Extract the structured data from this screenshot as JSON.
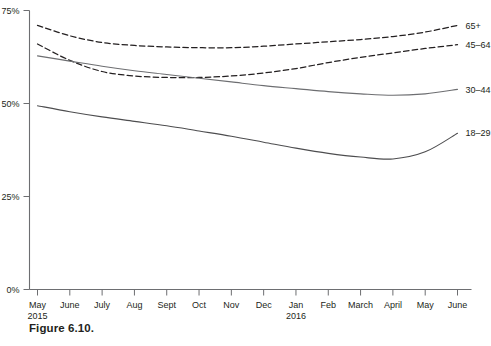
{
  "caption": "Figure 6.10.",
  "chart_data": {
    "type": "line",
    "title": "",
    "xlabel": "",
    "ylabel": "",
    "ylim": [
      0,
      75
    ],
    "yticks": [
      0,
      25,
      50,
      75
    ],
    "ytick_labels": [
      "0%",
      "25%",
      "50%",
      "75%"
    ],
    "grid": false,
    "legend_position": "right-inline-labels",
    "categories": [
      "May",
      "June",
      "July",
      "Aug",
      "Sept",
      "Oct",
      "Nov",
      "Dec",
      "Jan",
      "Feb",
      "March",
      "April",
      "May",
      "June"
    ],
    "category_sublabels": [
      "2015",
      "",
      "",
      "",
      "",
      "",
      "",
      "",
      "2016",
      "",
      "",
      "",
      "",
      ""
    ],
    "series": [
      {
        "name": "65+",
        "style": "dashed",
        "color": "#231f20",
        "values": [
          71.0,
          68.2,
          66.4,
          65.6,
          65.2,
          65.0,
          65.0,
          65.4,
          66.0,
          66.6,
          67.2,
          68.0,
          69.2,
          71.0
        ]
      },
      {
        "name": "45-64",
        "label": "45–64",
        "style": "dashed",
        "color": "#231f20",
        "values": [
          66.0,
          61.6,
          58.6,
          57.4,
          57.0,
          57.0,
          57.4,
          58.2,
          59.4,
          61.0,
          62.4,
          63.6,
          64.8,
          65.8
        ]
      },
      {
        "name": "30-44",
        "label": "30–44",
        "style": "solid",
        "color": "#6d6e71",
        "values": [
          62.8,
          61.4,
          60.0,
          58.8,
          57.8,
          56.8,
          55.8,
          54.8,
          54.0,
          53.2,
          52.6,
          52.2,
          52.6,
          53.8
        ]
      },
      {
        "name": "18-29",
        "label": "18–29",
        "style": "solid",
        "color": "#4d4d4f",
        "values": [
          49.4,
          47.8,
          46.4,
          45.2,
          44.0,
          42.6,
          41.2,
          39.6,
          38.0,
          36.6,
          35.6,
          35.1,
          37.0,
          42.0
        ]
      }
    ]
  }
}
